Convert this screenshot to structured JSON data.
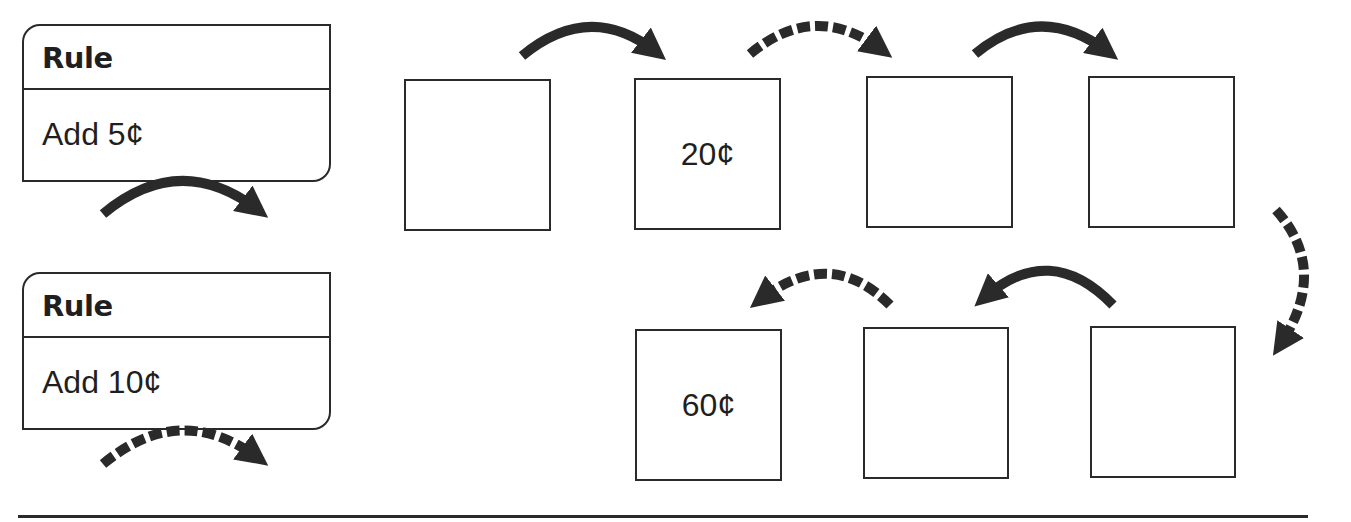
{
  "rules": [
    {
      "heading": "Rule",
      "text": "Add 5¢",
      "arrow_style": "solid"
    },
    {
      "heading": "Rule",
      "text": "Add 10¢",
      "arrow_style": "dashed"
    }
  ],
  "sequence": {
    "top_row": [
      {
        "value": ""
      },
      {
        "value": "20¢"
      },
      {
        "value": ""
      },
      {
        "value": ""
      }
    ],
    "bottom_row": [
      {
        "value": "60¢"
      },
      {
        "value": ""
      },
      {
        "value": ""
      }
    ],
    "transitions": [
      {
        "from": 1,
        "to": 2,
        "style": "solid"
      },
      {
        "from": 2,
        "to": 3,
        "style": "dashed"
      },
      {
        "from": 3,
        "to": 4,
        "style": "solid"
      },
      {
        "from": 4,
        "to": 5,
        "style": "dashed"
      },
      {
        "from": 5,
        "to": 6,
        "style": "solid"
      },
      {
        "from": 6,
        "to": 7,
        "style": "dashed"
      }
    ]
  },
  "colors": {
    "ink": "#2a2a2a",
    "background": "#ffffff"
  }
}
